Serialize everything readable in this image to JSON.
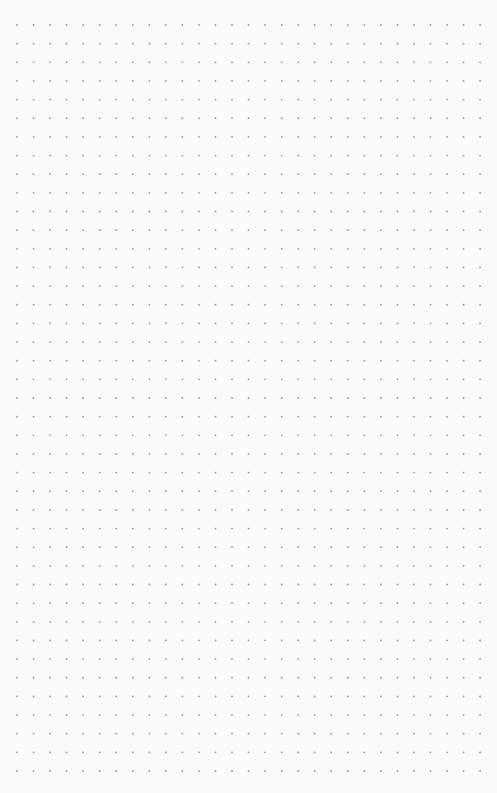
{
  "page": {
    "type": "dot-grid-paper",
    "background_color": "#fbfbfb",
    "dot_color": "#9a9a9a"
  },
  "grid": {
    "columns": 29,
    "rows": 41,
    "origin_x": 17,
    "origin_y": 25,
    "spacing_x": 16.54,
    "spacing_y": 18.65,
    "dot_radius": 0.9
  }
}
